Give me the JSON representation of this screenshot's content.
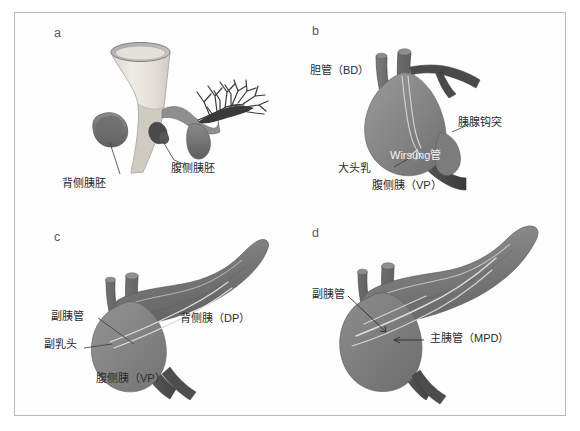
{
  "figure": {
    "title_visible": false,
    "background_color": "#ffffff",
    "frame_color": "#b9b9b9"
  },
  "colors": {
    "duodenum_light": "#e8e5de",
    "duodenum_rim": "#8d8d8d",
    "bud_dark": "#6e6e6e",
    "liver_bud_dark": "#3c3c3c",
    "duct_dark": "#5e5e5e",
    "pancreas_mid": "#8a8a8a",
    "pancreas_dark": "#6a6a6a",
    "duct_light": "#d8d8d8",
    "label_text": "#2b2b2b",
    "label_text_white": "#f2f2f2"
  },
  "panels": [
    {
      "id": "a",
      "letter": "a",
      "caption_labels": [
        {
          "name": "dorsal-pancreatic-bud",
          "text": "背侧胰胚"
        },
        {
          "name": "ventral-pancreatic-bud",
          "text": "腹侧胰胚"
        }
      ]
    },
    {
      "id": "b",
      "letter": "b",
      "caption_labels": [
        {
          "name": "bile-duct",
          "text": "胆管（BD）"
        },
        {
          "name": "uncinate-process",
          "text": "胰腺钩突"
        },
        {
          "name": "wirsung-duct",
          "text": "Wirsung管"
        },
        {
          "name": "major-papilla",
          "text": "大头乳"
        },
        {
          "name": "ventral-pancreas",
          "text": "腹侧胰（VP）"
        }
      ]
    },
    {
      "id": "c",
      "letter": "c",
      "caption_labels": [
        {
          "name": "accessory-pancreatic-duct",
          "text": "副胰管"
        },
        {
          "name": "minor-papilla",
          "text": "副乳头"
        },
        {
          "name": "dorsal-pancreas",
          "text": "背侧胰（DP）"
        },
        {
          "name": "ventral-pancreas",
          "text": "腹侧胰（VP）"
        }
      ]
    },
    {
      "id": "d",
      "letter": "d",
      "caption_labels": [
        {
          "name": "accessory-pancreatic-duct",
          "text": "副胰管"
        },
        {
          "name": "main-pancreatic-duct",
          "text": "主胰管（MPD）"
        }
      ]
    }
  ]
}
